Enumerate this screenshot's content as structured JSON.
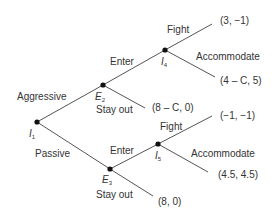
{
  "diagram": {
    "type": "game-tree",
    "nodes": [
      {
        "id": "I1",
        "letter": "I",
        "sub": "1",
        "x": 37,
        "y": 122
      },
      {
        "id": "E2",
        "letter": "E",
        "sub": "2",
        "x": 103,
        "y": 85
      },
      {
        "id": "I4",
        "letter": "I",
        "sub": "4",
        "x": 165,
        "y": 50
      },
      {
        "id": "E3",
        "letter": "E",
        "sub": "3",
        "x": 110,
        "y": 169
      },
      {
        "id": "I5",
        "letter": "I",
        "sub": "5",
        "x": 158,
        "y": 144
      }
    ],
    "edges": [
      {
        "from": "I1",
        "to": "E2",
        "label": "Aggressive"
      },
      {
        "from": "I1",
        "to": "E3",
        "label": "Passive"
      },
      {
        "from": "E2",
        "to": "I4",
        "label": "Enter"
      },
      {
        "from": "E2",
        "to": "payoff_e2_stay",
        "label": "Stay out"
      },
      {
        "from": "I4",
        "to": "payoff_i4_fight",
        "label": "Fight"
      },
      {
        "from": "I4",
        "to": "payoff_i4_acc",
        "label": "Accommodate"
      },
      {
        "from": "E3",
        "to": "I5",
        "label": "Enter"
      },
      {
        "from": "E3",
        "to": "payoff_e3_stay",
        "label": "Stay out"
      },
      {
        "from": "I5",
        "to": "payoff_i5_fight",
        "label": "Fight"
      },
      {
        "from": "I5",
        "to": "payoff_i5_acc",
        "label": "Accommodate"
      }
    ],
    "labels": {
      "aggressive": "Aggressive",
      "passive": "Passive",
      "enter_top": "Enter",
      "stay_out_top": "Stay out",
      "fight_top": "Fight",
      "accommodate_top": "Accommodate",
      "enter_bottom": "Enter",
      "stay_out_bottom": "Stay out",
      "fight_bottom": "Fight",
      "accommodate_bottom": "Accommodate"
    },
    "payoffs": {
      "i4_fight": "(3, −1)",
      "i4_accommodate": "(4 – C, 5)",
      "e2_stay_out": "(8 – C, 0)",
      "i5_fight": "(−1, −1)",
      "i5_accommodate": "(4.5, 4.5)",
      "e3_stay_out": "(8, 0)"
    },
    "node_labels": {
      "I1": {
        "letter": "I",
        "sub": "1"
      },
      "E2": {
        "letter": "E",
        "sub": "2"
      },
      "I4": {
        "letter": "I",
        "sub": "4"
      },
      "E3": {
        "letter": "E",
        "sub": "3"
      },
      "I5": {
        "letter": "I",
        "sub": "5"
      }
    },
    "colors": {
      "edge": "#555555",
      "node": "#111111",
      "text": "#333333",
      "background": "#ffffff"
    }
  }
}
